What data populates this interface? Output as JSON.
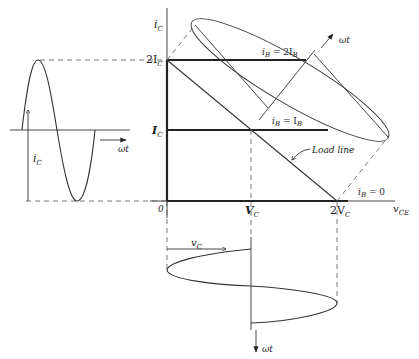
{
  "figure": {
    "colors": {
      "ink": "#222222",
      "background": "#ffffff",
      "dash": "#555555"
    }
  },
  "axes": {
    "y_label": "i",
    "y_label_sub": "C",
    "x_label": "v",
    "x_label_sub": "CE",
    "origin_label": "0",
    "y_ticks": [
      {
        "prefix": "2I",
        "sub": "C"
      },
      {
        "prefix": "I",
        "sub": "C"
      }
    ],
    "x_ticks": [
      {
        "prefix": "V",
        "sub": "C"
      },
      {
        "prefix": "2V",
        "sub": "C"
      }
    ]
  },
  "curves": {
    "ib_2": {
      "text": "i",
      "sub": "B",
      "eq": " = 2I",
      "sub2": "B"
    },
    "ib_1": {
      "text": "i",
      "sub": "B",
      "eq": " = I",
      "sub2": "B"
    },
    "ib_0": {
      "text": "i",
      "sub": "B",
      "eq": " = 0"
    },
    "load_line": "Load line"
  },
  "waveforms": {
    "current": {
      "label": "i",
      "label_sub": "C",
      "time_label": "ωt"
    },
    "voltage": {
      "label": "v",
      "label_sub": "C",
      "time_label": "ωt"
    },
    "ellipse_time_label": "ωt"
  }
}
